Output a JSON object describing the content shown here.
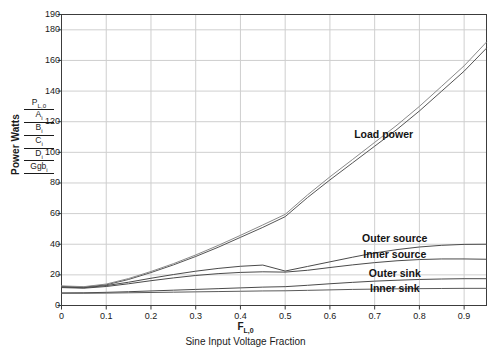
{
  "chart_data": {
    "type": "line",
    "title": "",
    "xlabel": "Sine Input Voltage Fraction",
    "xlabel_symbol": "F",
    "xlabel_symbol_sub": "L,0",
    "ylabel": "Power Watts",
    "ylabel_stack": [
      "P_L,0",
      "A_i",
      "B_i",
      "C_i",
      "D_i",
      "Ggb_i"
    ],
    "xlim": [
      0,
      0.95
    ],
    "ylim": [
      0,
      190
    ],
    "grid": true,
    "legend_position": "inline-annotations",
    "xticks": [
      0,
      0.1,
      0.2,
      0.3,
      0.4,
      0.5,
      0.6,
      0.7,
      0.8,
      0.9
    ],
    "xtick_labels": [
      "0",
      "0.1",
      "0.2",
      "0.3",
      "0.4",
      "0.5",
      "0.6",
      "0.7",
      "0.8",
      "0.9"
    ],
    "yticks": [
      0,
      20,
      40,
      60,
      80,
      100,
      120,
      140,
      160,
      180,
      190
    ],
    "ytick_labels": [
      "0",
      "20",
      "40",
      "60",
      "80",
      "100",
      "120",
      "140",
      "160",
      "180",
      "190"
    ],
    "x": [
      0,
      0.05,
      0.1,
      0.15,
      0.2,
      0.25,
      0.3,
      0.35,
      0.4,
      0.45,
      0.5,
      0.55,
      0.6,
      0.65,
      0.7,
      0.75,
      0.8,
      0.85,
      0.9,
      0.95
    ],
    "series": [
      {
        "name": "P_L,0",
        "label": "Load power",
        "color": "#555555",
        "values": [
          12.5,
          12.0,
          13.5,
          17.0,
          21.5,
          26.5,
          32.0,
          38.0,
          44.5,
          51.0,
          58.0,
          70.5,
          82.0,
          93.0,
          104.0,
          115.0,
          127.0,
          140.0,
          153.0,
          168.0
        ]
      },
      {
        "name": "A_i",
        "label": "Load power (second trace)",
        "color": "#8a8a8a",
        "values": [
          12.8,
          12.3,
          14.0,
          17.6,
          22.2,
          27.3,
          33.0,
          39.2,
          45.8,
          52.6,
          59.5,
          72.2,
          84.0,
          95.2,
          106.5,
          117.8,
          130.0,
          143.2,
          156.5,
          172.0
        ]
      },
      {
        "name": "B_i",
        "label": "Outer source",
        "color": "#4a4a4a",
        "values": [
          12.0,
          11.6,
          13.0,
          15.2,
          17.8,
          20.2,
          22.4,
          24.2,
          25.6,
          26.4,
          22.5,
          25.5,
          28.5,
          31.5,
          34.3,
          36.5,
          38.2,
          39.3,
          39.9,
          40.0
        ]
      },
      {
        "name": "C_i",
        "label": "Inner source",
        "color": "#4a4a4a",
        "values": [
          11.7,
          11.3,
          12.4,
          14.2,
          16.2,
          18.0,
          19.6,
          20.8,
          21.6,
          22.0,
          21.8,
          23.0,
          24.8,
          26.5,
          28.0,
          29.2,
          30.0,
          30.4,
          30.4,
          30.2
        ]
      },
      {
        "name": "D_i",
        "label": "Outer sink",
        "color": "#4a4a4a",
        "values": [
          8.2,
          8.3,
          8.6,
          9.0,
          9.5,
          10.0,
          10.5,
          11.0,
          11.5,
          12.0,
          12.3,
          13.2,
          14.2,
          15.1,
          15.9,
          16.5,
          17.0,
          17.3,
          17.5,
          17.5
        ]
      },
      {
        "name": "Ggb_i",
        "label": "Inner sink",
        "color": "#5a5a5a",
        "values": [
          8.0,
          8.0,
          8.1,
          8.3,
          8.5,
          8.7,
          8.9,
          9.1,
          9.3,
          9.5,
          9.6,
          9.9,
          10.2,
          10.5,
          10.7,
          10.9,
          11.0,
          11.1,
          11.2,
          11.2
        ]
      }
    ],
    "annotations": [
      {
        "text": "Load power",
        "x": 0.72,
        "y": 112
      },
      {
        "text": "Outer source",
        "x": 0.745,
        "y": 44
      },
      {
        "text": "Inner source",
        "x": 0.745,
        "y": 33.5
      },
      {
        "text": "Outer sink",
        "x": 0.745,
        "y": 21
      },
      {
        "text": "Inner sink",
        "x": 0.745,
        "y": 11.5
      }
    ],
    "colors": {
      "plot_border": "#3c3c3c",
      "grid": "#cfcfcf",
      "background": "#ffffff",
      "text": "#1a1a1a"
    }
  }
}
